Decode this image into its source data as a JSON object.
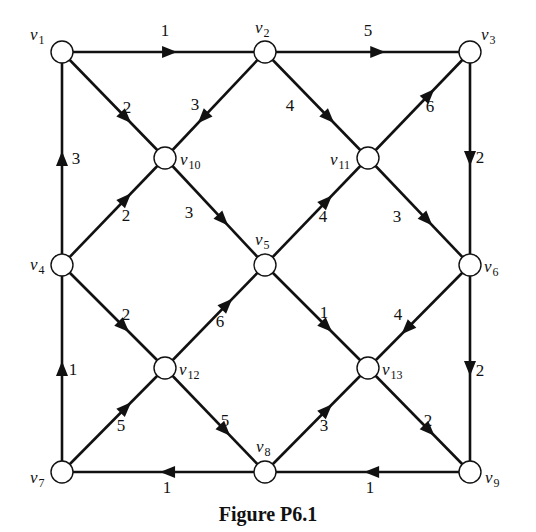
{
  "figure": {
    "caption": "Figure P6.1",
    "colors": {
      "stroke": "#111111",
      "node_fill": "#ffffff",
      "background": "#ffffff"
    }
  },
  "nodes": [
    {
      "id": "v1",
      "label": "v",
      "sub": "1",
      "x": 62,
      "y": 52,
      "lx": 30,
      "ly": 40,
      "anchor": "start"
    },
    {
      "id": "v2",
      "label": "v",
      "sub": "2",
      "x": 265,
      "y": 52,
      "lx": 255,
      "ly": 33,
      "anchor": "start"
    },
    {
      "id": "v3",
      "label": "v",
      "sub": "3",
      "x": 470,
      "y": 52,
      "lx": 481,
      "ly": 40,
      "anchor": "start"
    },
    {
      "id": "v10",
      "label": "v",
      "sub": "10",
      "x": 165,
      "y": 158,
      "lx": 180,
      "ly": 165,
      "anchor": "start"
    },
    {
      "id": "v11",
      "label": "v",
      "sub": "11",
      "x": 368,
      "y": 158,
      "lx": 330,
      "ly": 165,
      "anchor": "start"
    },
    {
      "id": "v4",
      "label": "v",
      "sub": "4",
      "x": 62,
      "y": 265,
      "lx": 30,
      "ly": 270,
      "anchor": "start"
    },
    {
      "id": "v5",
      "label": "v",
      "sub": "5",
      "x": 265,
      "y": 265,
      "lx": 255,
      "ly": 245,
      "anchor": "start"
    },
    {
      "id": "v6",
      "label": "v",
      "sub": "6",
      "x": 470,
      "y": 265,
      "lx": 484,
      "ly": 272,
      "anchor": "start"
    },
    {
      "id": "v12",
      "label": "v",
      "sub": "12",
      "x": 165,
      "y": 368,
      "lx": 179,
      "ly": 375,
      "anchor": "start"
    },
    {
      "id": "v13",
      "label": "v",
      "sub": "13",
      "x": 368,
      "y": 368,
      "lx": 382,
      "ly": 375,
      "anchor": "start"
    },
    {
      "id": "v7",
      "label": "v",
      "sub": "7",
      "x": 62,
      "y": 472,
      "lx": 30,
      "ly": 483,
      "anchor": "start"
    },
    {
      "id": "v8",
      "label": "v",
      "sub": "8",
      "x": 265,
      "y": 472,
      "lx": 256,
      "ly": 452,
      "anchor": "start"
    },
    {
      "id": "v9",
      "label": "v",
      "sub": "9",
      "x": 470,
      "y": 472,
      "lx": 485,
      "ly": 483,
      "anchor": "start"
    }
  ],
  "edges": [
    {
      "from": "v1",
      "to": "v2",
      "weight": "1",
      "t": 0.53,
      "wx": 165,
      "wy": 36
    },
    {
      "from": "v2",
      "to": "v3",
      "weight": "5",
      "t": 0.55,
      "wx": 368,
      "wy": 36
    },
    {
      "from": "v4",
      "to": "v1",
      "weight": "3",
      "t": 0.5,
      "wx": 76,
      "wy": 164
    },
    {
      "from": "v3",
      "to": "v6",
      "weight": "2",
      "t": 0.5,
      "wx": 480,
      "wy": 163
    },
    {
      "from": "v7",
      "to": "v4",
      "weight": "1",
      "t": 0.5,
      "wx": 73,
      "wy": 375
    },
    {
      "from": "v6",
      "to": "v9",
      "weight": "2",
      "t": 0.5,
      "wx": 480,
      "wy": 376
    },
    {
      "from": "v8",
      "to": "v7",
      "weight": "1",
      "t": 0.48,
      "wx": 167,
      "wy": 493
    },
    {
      "from": "v9",
      "to": "v8",
      "weight": "1",
      "t": 0.48,
      "wx": 370,
      "wy": 493
    },
    {
      "from": "v1",
      "to": "v10",
      "weight": "2",
      "t": 0.62,
      "wx": 127,
      "wy": 113
    },
    {
      "from": "v2",
      "to": "v10",
      "weight": "3",
      "t": 0.62,
      "wx": 195,
      "wy": 110
    },
    {
      "from": "v2",
      "to": "v11",
      "weight": "4",
      "t": 0.62,
      "wx": 290,
      "wy": 111
    },
    {
      "from": "v11",
      "to": "v3",
      "weight": "6",
      "t": 0.6,
      "wx": 430,
      "wy": 112
    },
    {
      "from": "v4",
      "to": "v10",
      "weight": "2",
      "t": 0.62,
      "wx": 126,
      "wy": 221
    },
    {
      "from": "v10",
      "to": "v5",
      "weight": "3",
      "t": 0.58,
      "wx": 189,
      "wy": 218
    },
    {
      "from": "v5",
      "to": "v11",
      "weight": "4",
      "t": 0.6,
      "wx": 323,
      "wy": 222
    },
    {
      "from": "v11",
      "to": "v6",
      "weight": "3",
      "t": 0.58,
      "wx": 397,
      "wy": 222
    },
    {
      "from": "v4",
      "to": "v12",
      "weight": "2",
      "t": 0.6,
      "wx": 126,
      "wy": 320
    },
    {
      "from": "v12",
      "to": "v5",
      "weight": "6",
      "t": 0.62,
      "wx": 220,
      "wy": 327
    },
    {
      "from": "v5",
      "to": "v13",
      "weight": "1",
      "t": 0.6,
      "wx": 324,
      "wy": 318
    },
    {
      "from": "v6",
      "to": "v13",
      "weight": "4",
      "t": 0.62,
      "wx": 398,
      "wy": 320
    },
    {
      "from": "v7",
      "to": "v12",
      "weight": "5",
      "t": 0.62,
      "wx": 121,
      "wy": 431
    },
    {
      "from": "v12",
      "to": "v8",
      "weight": "5",
      "t": 0.6,
      "wx": 225,
      "wy": 426
    },
    {
      "from": "v8",
      "to": "v13",
      "weight": "3",
      "t": 0.6,
      "wx": 324,
      "wy": 431
    },
    {
      "from": "v13",
      "to": "v9",
      "weight": "2",
      "t": 0.6,
      "wx": 428,
      "wy": 426
    }
  ]
}
